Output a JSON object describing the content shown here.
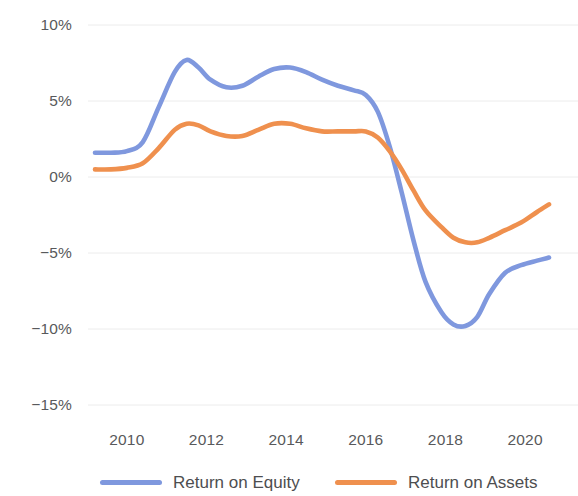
{
  "chart_data": {
    "type": "line",
    "title": "",
    "subtitle": "",
    "xlabel": "",
    "ylabel": "",
    "grid": true,
    "legend_position": "bottom",
    "xlim": [
      2009.2,
      2020.6
    ],
    "ylim": [
      -15,
      10
    ],
    "x_tick_labels": [
      "2010",
      "2012",
      "2014",
      "2016",
      "2018",
      "2020"
    ],
    "x_ticks": [
      2010,
      2012,
      2014,
      2016,
      2018,
      2020
    ],
    "y_tick_labels": [
      "10%",
      "5%",
      "0%",
      "−5%",
      "−10%",
      "−15%"
    ],
    "y_ticks": [
      10,
      5,
      0,
      -5,
      -10,
      -15
    ],
    "x": [
      2009.2,
      2009.6,
      2010.0,
      2010.4,
      2010.8,
      2011.2,
      2011.5,
      2011.8,
      2012.1,
      2012.5,
      2012.9,
      2013.3,
      2013.7,
      2014.1,
      2014.5,
      2014.9,
      2015.3,
      2015.7,
      2016.0,
      2016.3,
      2016.6,
      2016.9,
      2017.2,
      2017.5,
      2017.9,
      2018.2,
      2018.5,
      2018.8,
      2019.1,
      2019.5,
      2019.9,
      2020.3,
      2020.6
    ],
    "series": [
      {
        "name": "Return on Equity",
        "color": "#7f98de",
        "values": [
          1.6,
          1.6,
          1.7,
          2.3,
          4.6,
          6.9,
          7.7,
          7.2,
          6.4,
          5.9,
          6.0,
          6.6,
          7.1,
          7.2,
          6.9,
          6.4,
          6.0,
          5.7,
          5.4,
          4.3,
          2.0,
          -1.0,
          -4.2,
          -6.9,
          -8.9,
          -9.7,
          -9.8,
          -9.2,
          -7.7,
          -6.3,
          -5.8,
          -5.5,
          -5.3
        ]
      },
      {
        "name": "Return on Assets",
        "color": "#ef904e",
        "values": [
          0.5,
          0.5,
          0.6,
          0.9,
          1.9,
          3.1,
          3.5,
          3.4,
          3.0,
          2.7,
          2.7,
          3.1,
          3.5,
          3.5,
          3.2,
          3.0,
          3.0,
          3.0,
          3.0,
          2.6,
          1.7,
          0.5,
          -0.9,
          -2.2,
          -3.3,
          -4.0,
          -4.3,
          -4.3,
          -4.0,
          -3.5,
          -3.0,
          -2.3,
          -1.8
        ]
      }
    ]
  },
  "legend": {
    "entries": [
      {
        "label": "Return on Equity",
        "color": "#7f98de"
      },
      {
        "label": "Return on Assets",
        "color": "#ef904e"
      }
    ]
  },
  "colors": {
    "equity_blue": "#7f98de",
    "assets_orange": "#ef904e",
    "gridline": "#ececec",
    "tick_text": "#58595b",
    "legend_text": "#4d4e50",
    "background": "#ffffff"
  }
}
